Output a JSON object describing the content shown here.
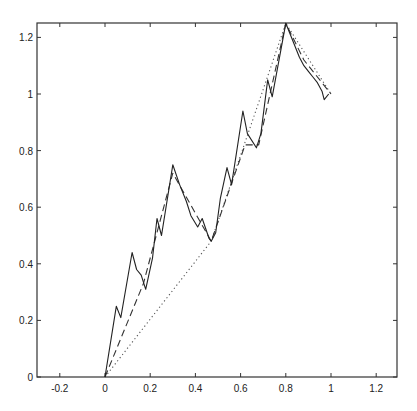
{
  "chart_data": {
    "type": "line",
    "title": "",
    "xlabel": "",
    "ylabel": "",
    "xlim": [
      -0.28,
      1.29
    ],
    "ylim": [
      0,
      1.25
    ],
    "grid": false,
    "legend": null,
    "x_ticks": [
      -0.2,
      0,
      0.2,
      0.4,
      0.6,
      0.8,
      1,
      1.2
    ],
    "x_tick_labels": [
      "-0.2",
      "0",
      "0.2",
      "0.4",
      "0.6",
      "0.8",
      "1",
      "1.2"
    ],
    "y_ticks": [
      0,
      0.2,
      0.4,
      0.6,
      0.8,
      1,
      1.2
    ],
    "y_tick_labels": [
      "0",
      "0.2",
      "0.4",
      "0.6",
      "0.8",
      "1",
      "1.2"
    ],
    "series": [
      {
        "name": "level-0 (dotted)",
        "style": "dotted",
        "color": "#555555",
        "points": [
          [
            0,
            0
          ],
          [
            0.47,
            0.48
          ],
          [
            0.8,
            1.25
          ],
          [
            1.0,
            1.0
          ]
        ]
      },
      {
        "name": "level-1 (dashed)",
        "style": "dashed",
        "color": "#333333",
        "points": [
          [
            0,
            0
          ],
          [
            0.17,
            0.33
          ],
          [
            0.3,
            0.72
          ],
          [
            0.47,
            0.48
          ],
          [
            0.62,
            0.82
          ],
          [
            0.68,
            0.82
          ],
          [
            0.8,
            1.25
          ],
          [
            0.88,
            1.12
          ],
          [
            1.0,
            1.0
          ]
        ]
      },
      {
        "name": "level-2 (solid)",
        "style": "solid",
        "color": "#222222",
        "points": [
          [
            0,
            0
          ],
          [
            0.05,
            0.25
          ],
          [
            0.07,
            0.21
          ],
          [
            0.12,
            0.44
          ],
          [
            0.14,
            0.38
          ],
          [
            0.16,
            0.36
          ],
          [
            0.18,
            0.31
          ],
          [
            0.21,
            0.42
          ],
          [
            0.23,
            0.56
          ],
          [
            0.25,
            0.5
          ],
          [
            0.3,
            0.75
          ],
          [
            0.33,
            0.68
          ],
          [
            0.36,
            0.62
          ],
          [
            0.38,
            0.57
          ],
          [
            0.41,
            0.53
          ],
          [
            0.43,
            0.56
          ],
          [
            0.46,
            0.49
          ],
          [
            0.47,
            0.48
          ],
          [
            0.49,
            0.51
          ],
          [
            0.51,
            0.63
          ],
          [
            0.54,
            0.74
          ],
          [
            0.56,
            0.68
          ],
          [
            0.61,
            0.94
          ],
          [
            0.63,
            0.86
          ],
          [
            0.67,
            0.81
          ],
          [
            0.69,
            0.86
          ],
          [
            0.72,
            1.05
          ],
          [
            0.74,
            0.99
          ],
          [
            0.8,
            1.25
          ],
          [
            0.83,
            1.19
          ],
          [
            0.86,
            1.13
          ],
          [
            0.88,
            1.1
          ],
          [
            0.9,
            1.08
          ],
          [
            0.92,
            1.06
          ],
          [
            0.94,
            1.04
          ],
          [
            0.96,
            1.01
          ],
          [
            0.97,
            0.98
          ],
          [
            0.99,
            1.0
          ]
        ]
      }
    ]
  }
}
